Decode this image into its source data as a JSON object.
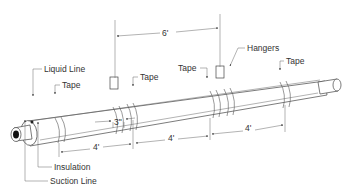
{
  "diagram": {
    "labels": {
      "liquid_line": "Liquid Line",
      "insulation": "Insulation",
      "suction_line": "Suction Line",
      "hangers": "Hangers",
      "tape_1": "Tape",
      "tape_2": "Tape",
      "tape_3": "Tape",
      "tape_4": "Tape"
    },
    "dimensions": {
      "hanger_spacing": "6'",
      "tape_gap": "3\"",
      "section_1": "4'",
      "section_2": "4'",
      "section_3": "4'"
    }
  }
}
